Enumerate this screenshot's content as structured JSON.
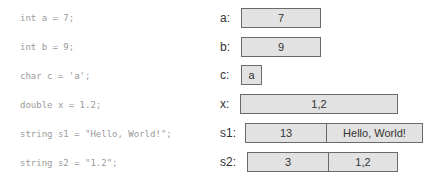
{
  "code": {
    "lines": [
      "int a = 7;",
      "int b = 9;",
      "char c = 'a';",
      "double x = 1.2;",
      "string s1 = \"Hello, World!\";",
      "string s2 = \"1.2\";"
    ]
  },
  "memory": {
    "a": {
      "label": "a:",
      "cells": [
        "7"
      ]
    },
    "b": {
      "label": "b:",
      "cells": [
        "9"
      ]
    },
    "c": {
      "label": "c:",
      "cells": [
        "a"
      ]
    },
    "x": {
      "label": "x:",
      "cells": [
        "1,2"
      ]
    },
    "s1": {
      "label": "s1:",
      "cells": [
        "13",
        "Hello, World!"
      ]
    },
    "s2": {
      "label": "s2:",
      "cells": [
        "3",
        "1,2"
      ]
    }
  },
  "colors": {
    "box_fill": "#e2e2e2",
    "box_border": "#6a6a6a",
    "code_text": "#9a9a9a",
    "label_text": "#333333"
  }
}
